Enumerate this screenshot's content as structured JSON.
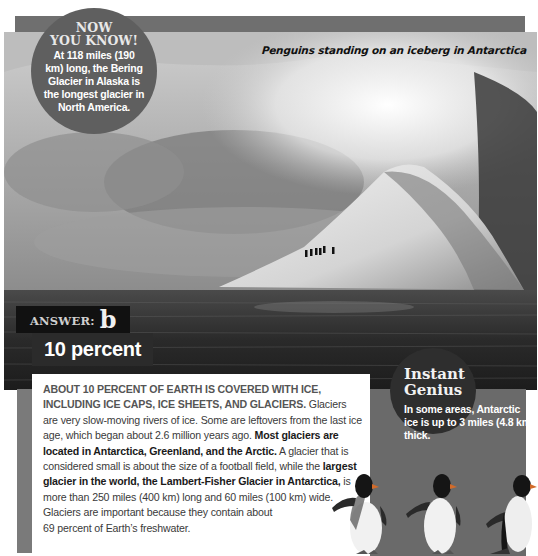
{
  "photo": {
    "caption": "Penguins standing on an iceberg in Antarctica",
    "subject": "iceberg-with-penguins"
  },
  "now_you_know": {
    "title_line1": "NOW",
    "title_line2": "YOU KNOW!",
    "body": "At 118 miles (190 km) long, the Bering Glacier in Alaska is the longest glacier in North America."
  },
  "answer": {
    "label": "ANSWER:",
    "letter": "b",
    "value": "10 percent"
  },
  "instant_genius": {
    "title_line1": "Instant",
    "title_line2": "Genius",
    "body": "In some areas, Antarctic ice is up to 3 miles (4.8 km) thick."
  },
  "article": {
    "lead": "About 10 percent of Earth is covered with ice, including ice caps, ice sheets, and glaciers.",
    "s1": " Glaciers are very slow-moving rivers of ice. Some are leftovers from the last ice age, which began about 2.6 million years ago. ",
    "bold1": "Most glaciers are located in Antarctica, Greenland, and the Arctic.",
    "s2": " A glacier that is considered small is about the size of a football field, while the ",
    "bold2": "largest glacier in the world, the Lambert-Fisher Glacier in Antarctica,",
    "s3": " is more than 250 miles (400 km) long and 60 miles (100 km) wide. Glaciers are important because they contain about",
    "s4": "69 percent of Earth’s freshwater."
  },
  "colors": {
    "gray_bar": "#6f6f6f",
    "circle_dark": "#2e2e2e",
    "circle_mid": "#5f5f5f",
    "answer_bg": "#111111"
  }
}
